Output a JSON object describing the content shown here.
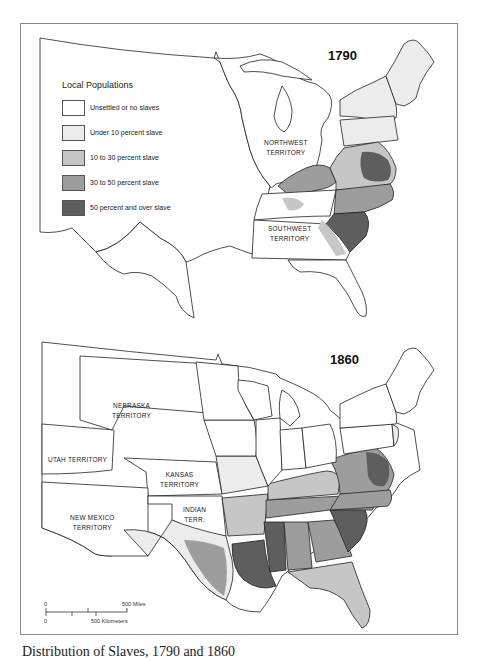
{
  "figure": {
    "caption": "Distribution of Slaves, 1790 and 1860"
  },
  "legend": {
    "title": "Local Populations",
    "items": [
      {
        "label": "Unsettled or no slaves",
        "color": "#ffffff"
      },
      {
        "label": "Under 10 percent slave",
        "color": "#ececec"
      },
      {
        "label": "10 to 30 percent slave",
        "color": "#c6c6c6"
      },
      {
        "label": "30 to 50 percent slave",
        "color": "#9d9d9d"
      },
      {
        "label": "50 percent and over slave",
        "color": "#5e5e5e"
      }
    ]
  },
  "map_1790": {
    "year": "1790",
    "labels": [
      {
        "line1": "NORTHWEST",
        "line2": "TERRITORY"
      },
      {
        "line1": "SOUTHWEST",
        "line2": "TERRITORY"
      }
    ]
  },
  "map_1860": {
    "year": "1860",
    "labels": [
      {
        "line1": "NEBRASKA",
        "line2": "TERRITORY"
      },
      {
        "line1": "UTAH TERRITORY",
        "line2": ""
      },
      {
        "line1": "KANSAS",
        "line2": "TERRITORY"
      },
      {
        "line1": "NEW MEXICO",
        "line2": "TERRITORY"
      },
      {
        "line1": "INDIAN",
        "line2": "TERR."
      }
    ]
  },
  "scale_bar": {
    "zero_top": "0",
    "miles": "500 Miles",
    "zero_bottom": "0",
    "kilometers": "500 Kilometers"
  }
}
